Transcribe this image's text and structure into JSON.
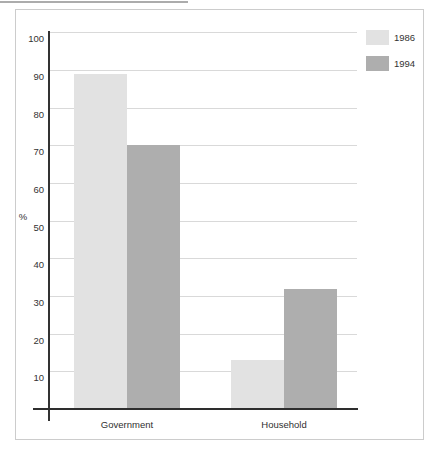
{
  "chart_data": {
    "type": "bar",
    "title": "",
    "categories": [
      "Government",
      "Household"
    ],
    "series": [
      {
        "name": "1986",
        "color": "#e2e2e2",
        "values": [
          89,
          13
        ]
      },
      {
        "name": "1994",
        "color": "#aeaeae",
        "values": [
          70,
          32
        ]
      }
    ],
    "xlabel": "",
    "ylabel": "%",
    "ylim": [
      0,
      100
    ],
    "yticks": [
      100,
      90,
      80,
      70,
      60,
      50,
      40,
      30,
      20,
      10
    ],
    "grid": true,
    "legend_position": "top-right"
  },
  "colors": {
    "background": "#ffffff",
    "frame_border": "#cccccc",
    "gridline": "#d9d9d9",
    "axis": "#333333",
    "text": "#333333",
    "series_1986": "#e2e2e2",
    "series_1994": "#aeaeae"
  }
}
